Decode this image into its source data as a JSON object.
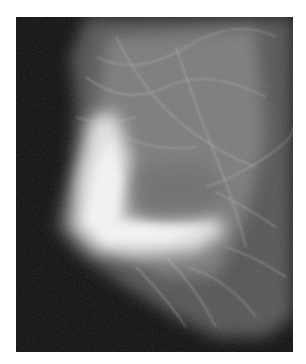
{
  "image": {
    "description": "Grayscale mammogram X-ray showing breast tissue with dense bright region at lower-left and fibrous strands",
    "background_color": "#ffffff",
    "frame_color": "#0c0c0c",
    "tissue_color": "#d8d8d8",
    "dense_color": "#f6f6f6"
  }
}
